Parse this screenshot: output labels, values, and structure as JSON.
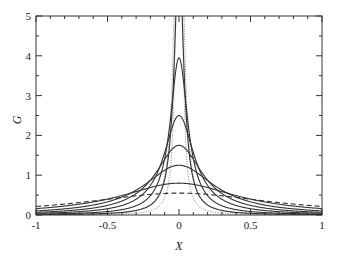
{
  "chart_data": {
    "type": "line",
    "title": "",
    "xlabel": "X",
    "ylabel": "G",
    "xlim": [
      -1,
      1
    ],
    "ylim": [
      0,
      5
    ],
    "xticks": [
      -1,
      -0.5,
      0,
      0.5,
      1
    ],
    "xtick_labels": [
      "-1",
      "-0.5",
      "0",
      "0.5",
      "1"
    ],
    "yticks": [
      0,
      1,
      2,
      3,
      4,
      5
    ],
    "ytick_labels": [
      "0",
      "1",
      "2",
      "3",
      "4",
      "5"
    ],
    "grid": false,
    "legend": null,
    "series": [
      {
        "name": "dotted-narrow-1",
        "style": "dotted",
        "peak": 30.0,
        "width": 0.012
      },
      {
        "name": "dotted-narrow-2",
        "style": "dotted",
        "peak": 12.0,
        "width": 0.03
      },
      {
        "name": "solid-1",
        "style": "solid",
        "peak": 6.5,
        "width": 0.04
      },
      {
        "name": "solid-2",
        "style": "solid",
        "peak": 3.95,
        "width": 0.075
      },
      {
        "name": "solid-3",
        "style": "solid",
        "peak": 2.5,
        "width": 0.13
      },
      {
        "name": "solid-4",
        "style": "solid",
        "peak": 1.75,
        "width": 0.2
      },
      {
        "name": "solid-5",
        "style": "solid",
        "peak": 1.25,
        "width": 0.3
      },
      {
        "name": "solid-6",
        "style": "solid",
        "peak": 0.8,
        "width": 0.5
      },
      {
        "name": "dashed",
        "style": "dashed",
        "peak": 0.55,
        "width": 0.8
      }
    ]
  }
}
